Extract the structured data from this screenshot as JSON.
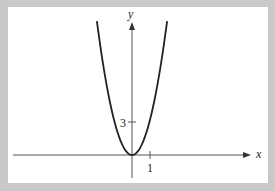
{
  "chart_data": {
    "type": "line",
    "title": "",
    "xlabel": "x",
    "ylabel": "y",
    "x_ticks": [
      {
        "value": 1,
        "label": "1"
      }
    ],
    "y_ticks": [
      {
        "value": 3,
        "label": "3"
      }
    ],
    "series": [
      {
        "name": "parabola",
        "x": [
          -1.95,
          -1.5,
          -1.0,
          -0.5,
          0,
          0.5,
          1.0,
          1.5,
          1.95
        ],
        "y": [
          12.1,
          7.2,
          3.2,
          0.8,
          0,
          0.8,
          3.2,
          7.2,
          12.1
        ]
      }
    ],
    "xlim": [
      -6.6,
      7.2
    ],
    "ylim": [
      -2.1,
      12.1
    ],
    "grid": false,
    "legend": "none"
  },
  "labels": {
    "x_axis": "x",
    "y_axis": "y",
    "x_tick_1": "1",
    "y_tick_3": "3"
  },
  "colors": {
    "frame": "#c9c9c9",
    "background": "#ffffff",
    "curve": "#222222",
    "axis": "#555555"
  }
}
